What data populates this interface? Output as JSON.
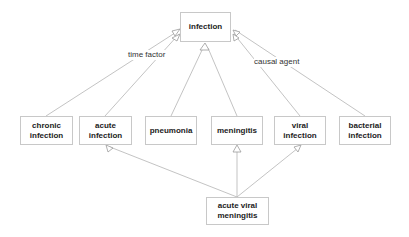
{
  "diagram": {
    "type": "concept hierarchy",
    "nodes": [
      {
        "id": "infection",
        "label": "infection",
        "x": 180,
        "y": 12,
        "w": 51,
        "h": 30
      },
      {
        "id": "chronic_infection",
        "label": "chronic infection",
        "x": 20,
        "y": 116,
        "w": 53,
        "h": 29
      },
      {
        "id": "acute_infection",
        "label": "acute infection",
        "x": 79,
        "y": 116,
        "w": 53,
        "h": 29
      },
      {
        "id": "pneumonia",
        "label": "pneumonia",
        "x": 145,
        "y": 116,
        "w": 52,
        "h": 29
      },
      {
        "id": "meningitis",
        "label": "meningitis",
        "x": 211,
        "y": 116,
        "w": 52,
        "h": 29
      },
      {
        "id": "viral_infection",
        "label": "viral infection",
        "x": 274,
        "y": 116,
        "w": 52,
        "h": 29
      },
      {
        "id": "bacterial_infection",
        "label": "bacterial infection",
        "x": 339,
        "y": 116,
        "w": 52,
        "h": 29
      },
      {
        "id": "acute_viral_meningitis",
        "label": "acute viral meningitis",
        "x": 206,
        "y": 197,
        "w": 63,
        "h": 28
      }
    ],
    "edges": [
      {
        "from": "chronic_infection",
        "to": "infection",
        "group": "time factor"
      },
      {
        "from": "acute_infection",
        "to": "infection",
        "group": "time factor"
      },
      {
        "from": "pneumonia",
        "to": "infection"
      },
      {
        "from": "meningitis",
        "to": "infection"
      },
      {
        "from": "viral_infection",
        "to": "infection",
        "group": "causal agent"
      },
      {
        "from": "bacterial_infection",
        "to": "infection",
        "group": "causal agent"
      },
      {
        "from": "acute_viral_meningitis",
        "to": "acute_infection"
      },
      {
        "from": "acute_viral_meningitis",
        "to": "meningitis"
      },
      {
        "from": "acute_viral_meningitis",
        "to": "viral_infection"
      }
    ],
    "edge_labels": {
      "time_factor": "time factor",
      "causal_agent": "causal agent"
    },
    "colors": {
      "line": "#b4b4b4",
      "border": "#c8c8c8",
      "text": "#222222"
    }
  }
}
